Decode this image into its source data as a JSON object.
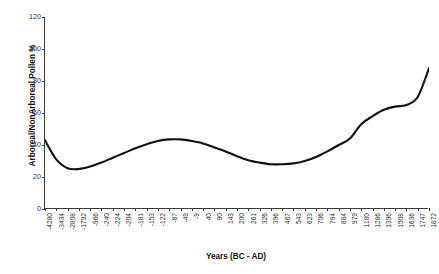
{
  "chart_data": {
    "type": "line",
    "title": "",
    "xlabel": "Years (BC - AD)",
    "ylabel": "Arboreal/NonArboreal Pollen %",
    "ylim": [
      0,
      120
    ],
    "yticks": [
      0,
      20,
      40,
      60,
      80,
      100,
      120
    ],
    "grid": false,
    "legend": "none",
    "categories": [
      "-4280",
      "-3434",
      "-2808",
      "-1792",
      "-966",
      "-240",
      "-224",
      "-204",
      "-181",
      "-153",
      "-122",
      "-87",
      "-49",
      "-9",
      "40",
      "90",
      "143",
      "200",
      "261",
      "326",
      "396",
      "467",
      "543",
      "623",
      "706",
      "794",
      "884",
      "979",
      "1180",
      "1286",
      "1396",
      "1508",
      "1636",
      "1747",
      "1872"
    ],
    "series": [
      {
        "name": "Arboreal/NonArboreal Pollen %",
        "values": [
          43,
          31,
          25.5,
          25,
          26.5,
          29,
          32,
          35,
          38,
          40.5,
          42.5,
          43.5,
          43.5,
          42.5,
          41,
          38.5,
          36,
          33,
          30.5,
          29,
          28,
          28,
          28.5,
          30,
          32.5,
          36,
          40,
          44,
          53,
          58,
          62,
          64,
          65,
          70,
          88
        ]
      }
    ]
  },
  "axes": {
    "y_axis_label": "Arboreal/NonArboreal Pollen %",
    "x_axis_label": "Years (BC - AD)"
  }
}
